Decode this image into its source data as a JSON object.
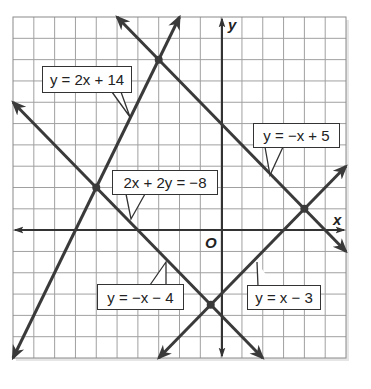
{
  "figure": {
    "axes": {
      "x_label": "x",
      "y_label": "y",
      "origin_label": "O",
      "x_range": [
        -10,
        6
      ],
      "y_range": [
        -6,
        10
      ],
      "grid_step": 1
    },
    "lines": [
      {
        "id": "line1",
        "equation": "y = 2x + 14",
        "slope": 2,
        "intercept": 14,
        "from": [
          -10,
          -6
        ],
        "to": [
          -2,
          10
        ]
      },
      {
        "id": "line2",
        "equation": "y = −x + 5",
        "slope": -1,
        "intercept": 5,
        "from": [
          -5,
          10
        ],
        "to": [
          6,
          -1
        ]
      },
      {
        "id": "line3",
        "equation": "2x + 2y = −8",
        "slope": -1,
        "intercept": -4,
        "from": [
          -10,
          6
        ],
        "to": [
          2,
          -6
        ]
      },
      {
        "id": "line4",
        "equation": "y = x − 3",
        "slope": 1,
        "intercept": -3,
        "from": [
          -3,
          -6
        ],
        "to": [
          6,
          3
        ]
      }
    ],
    "labels": {
      "l1": "y = 2x + 14",
      "l2": "y = −x + 5",
      "l3": "2x + 2y = −8",
      "l4": "y = −x − 4",
      "l5": "y = x − 3"
    },
    "intersections": [
      [
        -3,
        8
      ],
      [
        -6,
        2
      ],
      [
        4,
        1
      ],
      [
        -0.5,
        -3.5
      ]
    ],
    "colors": {
      "line": "#3a3a3a",
      "grid": "#9a9a9a",
      "axis": "#333333",
      "border": "#333333"
    }
  }
}
